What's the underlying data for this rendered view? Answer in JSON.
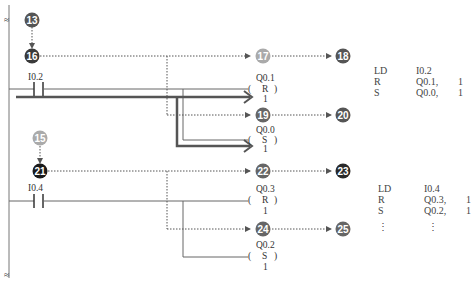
{
  "diagram": {
    "type": "ladder-logic",
    "nodes": [
      {
        "id": "13",
        "label": "13",
        "color": "#555555"
      },
      {
        "id": "16",
        "label": "16",
        "color": "#3a3a3a"
      },
      {
        "id": "17",
        "label": "17",
        "color": "#aaaaaa"
      },
      {
        "id": "18",
        "label": "18",
        "color": "#555555"
      },
      {
        "id": "19",
        "label": "19",
        "color": "#666666"
      },
      {
        "id": "20",
        "label": "20",
        "color": "#555555"
      },
      {
        "id": "15",
        "label": "15",
        "color": "#aaaaaa"
      },
      {
        "id": "21",
        "label": "21",
        "color": "#1a1a1a"
      },
      {
        "id": "22",
        "label": "22",
        "color": "#666666"
      },
      {
        "id": "23",
        "label": "23",
        "color": "#2a2a2a"
      },
      {
        "id": "24",
        "label": "24",
        "color": "#666666"
      },
      {
        "id": "25",
        "label": "25",
        "color": "#666666"
      }
    ],
    "rung1": {
      "contact": "I0.2",
      "coil_top": {
        "addr": "Q0.1",
        "op": "R",
        "n": "1"
      },
      "coil_bottom": {
        "addr": "Q0.0",
        "op": "S",
        "n": "1"
      }
    },
    "rung2": {
      "contact": "I0.4",
      "coil_top": {
        "addr": "Q0.3",
        "op": "R",
        "n": "1"
      },
      "coil_bottom": {
        "addr": "Q0.2",
        "op": "S",
        "n": "1"
      }
    },
    "il1": [
      {
        "op": "LD",
        "arg": "I0.2",
        "n": ""
      },
      {
        "op": "R",
        "arg": "Q0.1,",
        "n": "1"
      },
      {
        "op": "S",
        "arg": "Q0.0,",
        "n": "1"
      }
    ],
    "il2": [
      {
        "op": "LD",
        "arg": "I0.4",
        "n": ""
      },
      {
        "op": "R",
        "arg": "Q0.3,",
        "n": "1"
      },
      {
        "op": "S",
        "arg": "Q0.2,",
        "n": "1"
      },
      {
        "op": "⋮",
        "arg": "⋮",
        "n": ""
      }
    ],
    "rail_break_symbol": "≈",
    "paren_open": "(",
    "paren_close": ")"
  }
}
